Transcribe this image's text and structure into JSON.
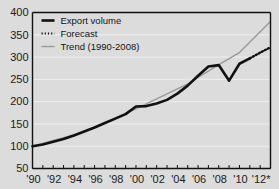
{
  "chart_data": {
    "type": "line",
    "title": "",
    "xlabel": "",
    "ylabel": "",
    "grid": "horizontal",
    "legend_position": "top-left",
    "xlim": [
      1990,
      2013
    ],
    "ylim": [
      50,
      400
    ],
    "y_ticks": [
      50,
      100,
      150,
      200,
      250,
      300,
      350,
      400
    ],
    "y_tick_labels": [
      "50",
      "100",
      "150",
      "200",
      "250",
      "300",
      "350",
      "400"
    ],
    "x_ticks": [
      1990,
      1991,
      1992,
      1993,
      1994,
      1995,
      1996,
      1997,
      1998,
      1999,
      2000,
      2001,
      2002,
      2003,
      2004,
      2005,
      2006,
      2007,
      2008,
      2009,
      2010,
      2011,
      2012,
      2013
    ],
    "x_tick_labels_shown": [
      "'90",
      "'92",
      "'94",
      "'96",
      "'98",
      "'00",
      "'02",
      "'04",
      "'06",
      "'08",
      "'10",
      "'12*"
    ],
    "x_label_years": [
      1990,
      1992,
      1994,
      1996,
      1998,
      2000,
      2002,
      2004,
      2006,
      2008,
      2010,
      2012
    ],
    "series": [
      {
        "name": "Export volume",
        "style": "solid-thick",
        "color": "#111111",
        "x": [
          1990,
          1991,
          1992,
          1993,
          1994,
          1995,
          1996,
          1997,
          1998,
          1999,
          2000,
          2001,
          2002,
          2003,
          2004,
          2005,
          2006,
          2007,
          2008,
          2009,
          2010,
          2011
        ],
        "values": [
          100,
          104,
          110,
          116,
          124,
          133,
          142,
          152,
          162,
          172,
          189,
          190,
          196,
          204,
          218,
          236,
          258,
          279,
          282,
          247,
          285,
          297
        ]
      },
      {
        "name": "Forecast",
        "style": "dotted",
        "color": "#111111",
        "x": [
          2011,
          2012,
          2013
        ],
        "values": [
          297,
          310,
          322
        ]
      },
      {
        "name": "Trend (1990-2008)",
        "style": "solid-thin",
        "color": "#9a9a9a",
        "x": [
          1990,
          1995,
          2000,
          2005,
          2008,
          2010,
          2013
        ],
        "values": [
          100,
          132,
          184,
          240,
          283,
          310,
          380
        ]
      }
    ]
  },
  "legend": {
    "items": [
      {
        "label": "Export volume",
        "swatch": "solid-thick"
      },
      {
        "label": "Forecast",
        "swatch": "dotted"
      },
      {
        "label": "Trend (1990-2008)",
        "swatch": "solid-thin"
      }
    ]
  },
  "axes": {
    "y_labels": [
      "400",
      "350",
      "300",
      "250",
      "200",
      "150",
      "100",
      "50"
    ],
    "x_labels": [
      "'90",
      "'92",
      "'94",
      "'96",
      "'98",
      "'00",
      "'02",
      "'04",
      "'06",
      "'08",
      "'10",
      "'12*"
    ]
  },
  "colors": {
    "background": "#dcdcdc",
    "axis": "#111111",
    "grid": "#efefef",
    "actual": "#111111",
    "trend": "#9a9a9a"
  }
}
